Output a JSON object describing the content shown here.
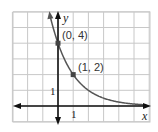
{
  "chart_data": {
    "type": "line",
    "title": "",
    "xlabel": "x",
    "ylabel": "y",
    "function": "y = 4(1/2)^x",
    "x_range": [
      -3,
      6
    ],
    "y_range": [
      -1,
      6
    ],
    "grid": true,
    "tick_labels": {
      "x": "1",
      "y": "1"
    },
    "points": [
      {
        "x": 0,
        "y": 4,
        "label": "(0, 4)"
      },
      {
        "x": 1,
        "y": 2,
        "label": "(1, 2)"
      }
    ],
    "curve_color": "#555555",
    "axis_color": "#111111",
    "grid_color": "#c8c8c8"
  },
  "labels": {
    "x_axis": "x",
    "y_axis": "y",
    "x_tick": "1",
    "y_tick": "1",
    "point1": "(0, 4)",
    "point2": "(1, 2)"
  }
}
